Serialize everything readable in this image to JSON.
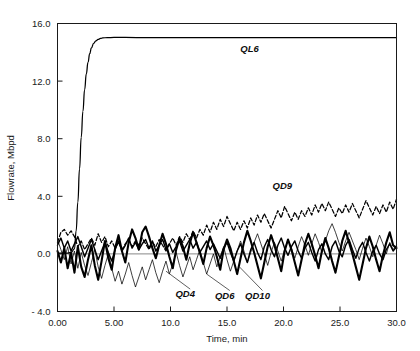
{
  "chart_data": {
    "type": "line",
    "title": "",
    "subtitle": "",
    "xlabel": "Time, min",
    "ylabel": "Flowrate, Mbpd",
    "xlim": [
      0,
      30
    ],
    "ylim": [
      -4.0,
      16.0
    ],
    "xticks": [
      0,
      5,
      10,
      15,
      20,
      25,
      30
    ],
    "xticklabels": [
      "0.00",
      "5.00",
      "10.0",
      "15.0",
      "20.0",
      "25.0",
      "30.0"
    ],
    "yticks": [
      -4.0,
      0.0,
      4.0,
      8.0,
      12.0,
      16.0
    ],
    "yticklabels": [
      "- 4.0",
      "0.0",
      "4.0",
      "8.0",
      "12.0",
      "16.0"
    ],
    "grid": false,
    "legend": "inline-annotations",
    "annotations": [
      {
        "text": "QL6",
        "x": 17.0,
        "y": 14.0,
        "leader": false
      },
      {
        "text": "QD9",
        "x": 19.9,
        "y": 4.5,
        "leader": false
      },
      {
        "text": "QD4",
        "x": 11.3,
        "y": -3.0,
        "leader": true
      },
      {
        "text": "QD6",
        "x": 14.8,
        "y": -3.1,
        "leader": true
      },
      {
        "text": "QD10",
        "x": 17.7,
        "y": -3.1,
        "leader": true
      }
    ],
    "series": [
      {
        "name": "QL6",
        "style": "solid-thin",
        "description": "step response rising from 0 at t=1.5 to plateau ~15.0 Mbpd",
        "x": [
          0.0,
          0.4,
          0.8,
          1.2,
          1.5,
          1.65,
          1.8,
          1.95,
          2.1,
          2.25,
          2.4,
          2.55,
          2.7,
          2.85,
          3.0,
          3.2,
          3.4,
          3.6,
          3.8,
          4.0,
          4.4,
          5.0,
          6.0,
          8.0,
          10.0,
          13.0,
          16.0,
          20.0,
          24.0,
          27.0,
          30.0
        ],
        "y": [
          0.05,
          0.05,
          0.05,
          0.1,
          0.35,
          1.6,
          3.6,
          5.9,
          8.1,
          9.9,
          11.4,
          12.5,
          13.3,
          13.9,
          14.3,
          14.62,
          14.8,
          14.9,
          14.96,
          15.0,
          15.02,
          15.03,
          15.03,
          15.02,
          15.02,
          15.02,
          15.02,
          15.02,
          15.02,
          15.02,
          15.02
        ]
      },
      {
        "name": "QD9",
        "style": "dashed",
        "description": "noisy dashed trace drifting upward from ~1.2 to ~3.5 Mbpd",
        "x": [
          0.0,
          0.3,
          0.6,
          0.9,
          1.2,
          1.5,
          1.8,
          2.1,
          2.4,
          2.7,
          3.0,
          3.3,
          3.6,
          3.9,
          4.2,
          4.5,
          4.8,
          5.1,
          5.4,
          5.7,
          6.0,
          6.3,
          6.6,
          6.9,
          7.2,
          7.5,
          7.8,
          8.1,
          8.4,
          8.7,
          9.0,
          9.3,
          9.6,
          9.9,
          10.2,
          10.5,
          10.8,
          11.1,
          11.4,
          11.7,
          12.0,
          12.3,
          12.6,
          12.9,
          13.2,
          13.5,
          13.8,
          14.1,
          14.4,
          14.7,
          15.0,
          15.3,
          15.6,
          15.9,
          16.2,
          16.5,
          16.8,
          17.1,
          17.4,
          17.7,
          18.0,
          18.3,
          18.6,
          18.9,
          19.2,
          19.5,
          19.8,
          20.1,
          20.4,
          20.7,
          21.0,
          21.3,
          21.6,
          21.9,
          22.2,
          22.5,
          22.8,
          23.1,
          23.4,
          23.7,
          24.0,
          24.3,
          24.6,
          24.9,
          25.2,
          25.5,
          25.8,
          26.1,
          26.4,
          26.7,
          27.0,
          27.3,
          27.6,
          27.9,
          28.2,
          28.5,
          28.8,
          29.1,
          29.4,
          29.7,
          30.0
        ],
        "y": [
          0.8,
          1.5,
          1.7,
          1.3,
          1.6,
          1.2,
          0.5,
          0.9,
          0.3,
          0.7,
          1.1,
          0.6,
          1.4,
          0.8,
          1.2,
          0.5,
          0.9,
          0.4,
          0.8,
          0.3,
          0.7,
          1.0,
          0.5,
          0.9,
          0.6,
          1.1,
          0.7,
          0.3,
          0.8,
          0.5,
          1.0,
          0.6,
          0.2,
          0.7,
          1.1,
          0.6,
          1.2,
          0.8,
          1.4,
          1.0,
          1.6,
          1.1,
          1.7,
          1.3,
          2.0,
          1.5,
          2.2,
          1.7,
          2.4,
          1.9,
          2.6,
          2.1,
          1.6,
          2.2,
          1.7,
          2.3,
          1.8,
          2.5,
          2.0,
          2.7,
          2.2,
          2.8,
          2.3,
          1.8,
          2.4,
          3.0,
          2.5,
          3.3,
          2.8,
          2.3,
          2.9,
          2.4,
          3.0,
          2.6,
          3.2,
          2.7,
          3.4,
          2.9,
          3.5,
          3.0,
          3.6,
          3.1,
          2.6,
          3.2,
          2.8,
          3.4,
          2.9,
          3.5,
          3.0,
          2.5,
          3.1,
          3.7,
          3.2,
          2.7,
          3.3,
          2.8,
          3.4,
          2.9,
          3.6,
          3.1,
          3.8
        ]
      },
      {
        "name": "QD10",
        "style": "solid-thick",
        "description": "heavy noisy trace oscillating around 0 Mbpd, band roughly -2.5 to +2.0",
        "x": [
          0.0,
          0.3,
          0.6,
          0.9,
          1.2,
          1.5,
          1.8,
          2.1,
          2.4,
          2.7,
          3.0,
          3.3,
          3.6,
          3.9,
          4.2,
          4.5,
          4.8,
          5.1,
          5.4,
          5.7,
          6.0,
          6.3,
          6.6,
          6.9,
          7.2,
          7.5,
          7.8,
          8.1,
          8.4,
          8.7,
          9.0,
          9.3,
          9.6,
          9.9,
          10.2,
          10.5,
          10.8,
          11.1,
          11.4,
          11.7,
          12.0,
          12.3,
          12.6,
          12.9,
          13.2,
          13.5,
          13.8,
          14.1,
          14.4,
          14.7,
          15.0,
          15.3,
          15.6,
          15.9,
          16.2,
          16.5,
          16.8,
          17.1,
          17.4,
          17.7,
          18.0,
          18.3,
          18.6,
          18.9,
          19.2,
          19.5,
          19.8,
          20.1,
          20.4,
          20.7,
          21.0,
          21.3,
          21.6,
          21.9,
          22.2,
          22.5,
          22.8,
          23.1,
          23.4,
          23.7,
          24.0,
          24.3,
          24.6,
          24.9,
          25.2,
          25.5,
          25.8,
          26.1,
          26.4,
          26.7,
          27.0,
          27.3,
          27.6,
          27.9,
          28.2,
          28.5,
          28.8,
          29.1,
          29.4,
          29.7,
          30.0
        ],
        "y": [
          0.2,
          -0.6,
          0.4,
          -1.0,
          0.1,
          -1.3,
          0.5,
          -0.9,
          -1.6,
          -0.4,
          0.6,
          -0.8,
          -1.8,
          -0.5,
          0.9,
          -0.3,
          -1.1,
          0.4,
          1.3,
          0.2,
          -0.6,
          0.8,
          1.7,
          1.1,
          0.3,
          1.5,
          1.9,
          1.2,
          0.4,
          -0.3,
          0.6,
          1.4,
          0.7,
          -0.2,
          -1.0,
          0.3,
          1.1,
          0.5,
          -0.4,
          0.7,
          1.5,
          0.8,
          0.1,
          -0.7,
          0.4,
          1.2,
          0.6,
          -0.2,
          -1.1,
          0.3,
          1.0,
          0.4,
          -0.5,
          -1.4,
          -0.3,
          0.8,
          1.6,
          0.9,
          0.1,
          -0.8,
          -1.7,
          -0.6,
          0.5,
          1.3,
          0.6,
          -0.3,
          -1.2,
          0.2,
          1.0,
          0.3,
          -0.6,
          -1.5,
          -0.4,
          0.7,
          1.4,
          0.7,
          -0.1,
          -1.0,
          0.2,
          1.1,
          0.4,
          -0.5,
          -1.3,
          -0.2,
          0.9,
          1.6,
          0.8,
          0.0,
          -0.9,
          -1.8,
          -0.7,
          0.4,
          1.2,
          0.5,
          -0.4,
          -1.2,
          -0.1,
          0.8,
          1.5,
          0.6,
          0.4
        ]
      },
      {
        "name": "QD6",
        "style": "solid-medium",
        "description": "medium-weight noisy trace oscillating about 0 Mbpd",
        "x": [
          0.0,
          0.3,
          0.6,
          0.9,
          1.2,
          1.5,
          1.8,
          2.1,
          2.4,
          2.7,
          3.0,
          3.3,
          3.6,
          3.9,
          4.2,
          4.5,
          4.8,
          5.1,
          5.4,
          5.7,
          6.0,
          6.3,
          6.6,
          6.9,
          7.2,
          7.5,
          7.8,
          8.1,
          8.4,
          8.7,
          9.0,
          9.3,
          9.6,
          9.9,
          10.2,
          10.5,
          10.8,
          11.1,
          11.4,
          11.7,
          12.0,
          12.3,
          12.6,
          12.9,
          13.2,
          13.5,
          13.8,
          14.1,
          14.4,
          14.7,
          15.0,
          15.3,
          15.6,
          15.9,
          16.2,
          16.5,
          16.8,
          17.1,
          17.4,
          17.7,
          18.0,
          18.3,
          18.6,
          18.9,
          19.2,
          19.5,
          19.8,
          20.1,
          20.4,
          20.7,
          21.0,
          21.3,
          21.6,
          21.9,
          22.2,
          22.5,
          22.8,
          23.1,
          23.4,
          23.7,
          24.0,
          24.3,
          24.6,
          24.9,
          25.2,
          25.5,
          25.8,
          26.1,
          26.4,
          26.7,
          27.0,
          27.3,
          27.6,
          27.9,
          28.2,
          28.5,
          28.8,
          29.1,
          29.4,
          29.7,
          30.0
        ],
        "y": [
          0.6,
          1.1,
          0.4,
          0.9,
          0.2,
          0.7,
          1.2,
          0.5,
          -0.2,
          0.4,
          1.0,
          0.3,
          -0.4,
          0.2,
          0.8,
          0.1,
          -0.5,
          0.3,
          0.9,
          0.2,
          0.6,
          1.1,
          0.4,
          0.8,
          0.3,
          0.7,
          1.0,
          0.4,
          0.9,
          0.2,
          0.6,
          1.0,
          0.3,
          0.7,
          0.1,
          0.5,
          0.9,
          0.2,
          0.6,
          1.0,
          0.4,
          0.8,
          0.1,
          0.5,
          0.9,
          0.3,
          0.7,
          0.2,
          -0.3,
          0.4,
          0.8,
          0.1,
          -0.5,
          0.2,
          0.7,
          0.0,
          -0.6,
          0.3,
          0.8,
          0.1,
          -0.4,
          0.5,
          1.0,
          0.3,
          -0.2,
          0.6,
          1.1,
          0.4,
          -0.1,
          0.5,
          0.9,
          0.2,
          -0.3,
          0.4,
          0.8,
          0.1,
          -0.5,
          0.3,
          0.7,
          0.0,
          -0.4,
          0.5,
          0.9,
          0.2,
          -0.2,
          0.6,
          1.0,
          0.3,
          -0.3,
          0.4,
          0.8,
          0.1,
          -0.5,
          0.2,
          0.6,
          0.0,
          -0.4,
          0.3,
          0.7,
          0.2,
          0.5
        ]
      },
      {
        "name": "QD4",
        "style": "solid-thin",
        "description": "light thin noisy trace dipping below zero, band roughly -2.5 to +2.0",
        "x": [
          0.0,
          0.3,
          0.6,
          0.9,
          1.2,
          1.5,
          1.8,
          2.1,
          2.4,
          2.7,
          3.0,
          3.3,
          3.6,
          3.9,
          4.2,
          4.5,
          4.8,
          5.1,
          5.4,
          5.7,
          6.0,
          6.3,
          6.6,
          6.9,
          7.2,
          7.5,
          7.8,
          8.1,
          8.4,
          8.7,
          9.0,
          9.3,
          9.6,
          9.9,
          10.2,
          10.5,
          10.8,
          11.1,
          11.4,
          11.7,
          12.0,
          12.3,
          12.6,
          12.9,
          13.2,
          13.5,
          13.8,
          14.1,
          14.4,
          14.7,
          15.0,
          15.3,
          15.6,
          15.9,
          16.2,
          16.5,
          16.8,
          17.1,
          17.4,
          17.7,
          18.0,
          18.3,
          18.6,
          18.9,
          19.2,
          19.5,
          19.8,
          20.1,
          20.4,
          20.7,
          21.0,
          21.3,
          21.6,
          21.9,
          22.2,
          22.5,
          22.8,
          23.1,
          23.4,
          23.7,
          24.0,
          24.3,
          24.6,
          24.9,
          25.2,
          25.5,
          25.8,
          26.1,
          26.4,
          26.7,
          27.0,
          27.3,
          27.6,
          27.9,
          28.2,
          28.5,
          28.8,
          29.1,
          29.4,
          29.7,
          30.0
        ],
        "y": [
          1.0,
          0.3,
          -0.4,
          0.5,
          -0.7,
          0.2,
          -1.0,
          0.1,
          -0.8,
          -1.5,
          -0.6,
          0.3,
          -0.9,
          -1.7,
          -0.8,
          0.0,
          -1.0,
          -1.9,
          -1.2,
          -2.1,
          -1.4,
          -0.6,
          -1.5,
          -2.3,
          -1.6,
          -0.9,
          -1.8,
          -1.1,
          -0.4,
          -1.3,
          -2.0,
          -1.2,
          -0.5,
          -1.4,
          -0.7,
          0.1,
          -0.8,
          -1.6,
          -0.9,
          -0.2,
          -1.1,
          -0.4,
          0.3,
          -0.6,
          -1.4,
          -0.7,
          0.0,
          -0.9,
          -0.2,
          0.5,
          -0.4,
          -1.2,
          -0.5,
          0.2,
          0.9,
          0.2,
          -0.6,
          0.1,
          0.8,
          1.4,
          0.7,
          0.0,
          -0.8,
          0.1,
          0.8,
          0.2,
          -0.5,
          0.3,
          1.0,
          0.4,
          -0.3,
          0.5,
          1.2,
          0.6,
          -0.1,
          0.7,
          1.4,
          0.8,
          0.1,
          0.9,
          1.6,
          2.1,
          1.5,
          0.8,
          0.2,
          0.9,
          1.5,
          0.9,
          0.3,
          -0.4,
          0.4,
          1.1,
          0.5,
          -0.2,
          0.6,
          1.3,
          0.7,
          0.0,
          0.8,
          0.3,
          0.6
        ]
      }
    ]
  }
}
